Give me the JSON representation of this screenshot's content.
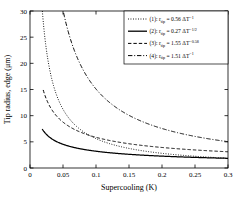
{
  "chart_data": {
    "type": "line",
    "title": "",
    "xlabel": "Supercooling (K)",
    "ylabel": "Tip radius, edge (μm)",
    "xlim": [
      0,
      0.3
    ],
    "ylim": [
      0,
      30
    ],
    "xticks": [
      0,
      0.05,
      0.1,
      0.15,
      0.2,
      0.25,
      0.3
    ],
    "xtick_labels": [
      "0",
      "0.05",
      "0.1",
      "0.15",
      "0.2",
      "0.25",
      "0.3"
    ],
    "yticks": [
      0,
      5,
      10,
      15,
      20,
      25,
      30
    ],
    "ytick_labels": [
      "0",
      "5",
      "10",
      "15",
      "20",
      "25",
      "30"
    ],
    "grid": false,
    "legend_position": "top-right",
    "series": [
      {
        "name": "(1)",
        "label_prefix": "(1): r",
        "label_sub": "tip",
        "label_eq": " = 0.56 ΔT",
        "label_exp": "−1",
        "coefficient": 0.56,
        "exponent": -1,
        "style": "dotted",
        "color": "#000000",
        "x_start": 0.018,
        "points": [
          [
            0.019,
            29.5
          ],
          [
            0.025,
            22.4
          ],
          [
            0.03,
            18.7
          ],
          [
            0.04,
            14.0
          ],
          [
            0.05,
            11.2
          ],
          [
            0.06,
            9.3
          ],
          [
            0.08,
            7.0
          ],
          [
            0.1,
            5.6
          ],
          [
            0.12,
            4.7
          ],
          [
            0.15,
            3.7
          ],
          [
            0.2,
            2.8
          ],
          [
            0.25,
            2.24
          ],
          [
            0.3,
            1.87
          ]
        ]
      },
      {
        "name": "(2)",
        "label_prefix": "(2): r",
        "label_sub": "tip",
        "label_eq": " = 0.27 ΔT",
        "label_exp": "−1/2",
        "coefficient": 0.27,
        "exponent": -0.5,
        "style": "solid",
        "color": "#000000",
        "x_start": 0.0185,
        "points": [
          [
            0.0185,
            30.0
          ],
          [
            0.03,
            22.0
          ],
          [
            0.04,
            17.5
          ],
          [
            0.05,
            14.4
          ],
          [
            0.06,
            12.2
          ],
          [
            0.08,
            9.2
          ],
          [
            0.1,
            7.4
          ],
          [
            0.12,
            6.2
          ],
          [
            0.15,
            4.9
          ],
          [
            0.18,
            4.1
          ],
          [
            0.2,
            3.7
          ],
          [
            0.25,
            2.9
          ],
          [
            0.3,
            1.85
          ]
        ]
      },
      {
        "name": "(3)",
        "label_prefix": "(3): r",
        "label_sub": "tip",
        "label_eq": " = 1.55 ΔT",
        "label_exp": "−0.58",
        "coefficient": 1.55,
        "exponent": -0.58,
        "style": "dashed",
        "color": "#000000",
        "x_start": 0.02,
        "points": [
          [
            0.02,
            14.9
          ],
          [
            0.03,
            11.8
          ],
          [
            0.04,
            10.0
          ],
          [
            0.05,
            8.8
          ],
          [
            0.06,
            7.9
          ],
          [
            0.08,
            6.6
          ],
          [
            0.1,
            5.8
          ],
          [
            0.12,
            5.2
          ],
          [
            0.15,
            4.6
          ],
          [
            0.2,
            3.9
          ],
          [
            0.25,
            3.4
          ],
          [
            0.3,
            3.1
          ]
        ]
      },
      {
        "name": "(4)",
        "label_prefix": "(4): r",
        "label_sub": "tip",
        "label_eq": " = 1.51 ΔT",
        "label_exp": "−1",
        "coefficient": 1.51,
        "exponent": -1,
        "style": "dashdot",
        "color": "#000000",
        "x_start": 0.0503,
        "points": [
          [
            0.0503,
            30.0
          ],
          [
            0.06,
            25.2
          ],
          [
            0.07,
            21.6
          ],
          [
            0.08,
            18.9
          ],
          [
            0.1,
            15.1
          ],
          [
            0.12,
            12.6
          ],
          [
            0.15,
            10.1
          ],
          [
            0.18,
            8.4
          ],
          [
            0.2,
            7.55
          ],
          [
            0.25,
            6.04
          ],
          [
            0.3,
            5.03
          ]
        ]
      }
    ]
  }
}
